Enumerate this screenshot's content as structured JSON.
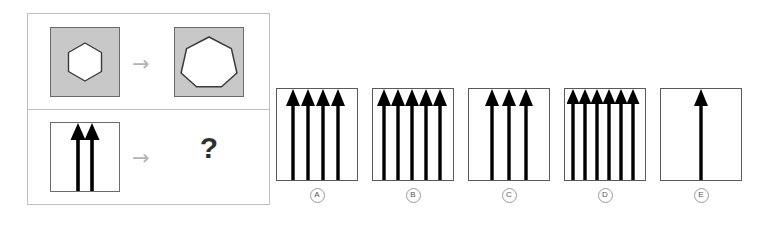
{
  "puzzle": {
    "type": "visual-analogy-matrix",
    "stimulus": {
      "top_row": {
        "source": {
          "shape_name": "hexagon",
          "sides": 6,
          "fill": "#ffffff",
          "tile_fill": "#c8c8c8",
          "tile_stroke": "#6b6b6b",
          "size_rel": 0.62
        },
        "operator": "→",
        "operator_name": "transforms-to-arrow",
        "result": {
          "shape_name": "heptagon",
          "sides": 7,
          "fill": "#ffffff",
          "tile_fill": "#c8c8c8",
          "tile_stroke": "#6b6b6b",
          "size_rel": 0.74
        }
      },
      "bottom_row": {
        "source": {
          "shape_name": "up-arrows",
          "arrow_count": 2,
          "fill": "#000000",
          "tile_fill": "#ffffff",
          "tile_stroke": "#6b6b6b"
        },
        "operator": "→",
        "operator_name": "transforms-to-arrow",
        "result": {
          "shape_name": "unknown",
          "label": "?"
        }
      }
    },
    "options": [
      {
        "letter": "A",
        "arrow_count": 4
      },
      {
        "letter": "B",
        "arrow_count": 5
      },
      {
        "letter": "C",
        "arrow_count": 3
      },
      {
        "letter": "D",
        "arrow_count": 6
      },
      {
        "letter": "E",
        "arrow_count": 1
      }
    ],
    "colors": {
      "tile_gray": "#c8c8c8",
      "tile_border": "#6b6b6b",
      "frame_border": "#bfbfbf",
      "option_border": "#5a5a5a",
      "operator_gray": "#b4b4b4",
      "question_dark": "#303030",
      "label_gray": "#666666",
      "background": "#ffffff"
    }
  }
}
